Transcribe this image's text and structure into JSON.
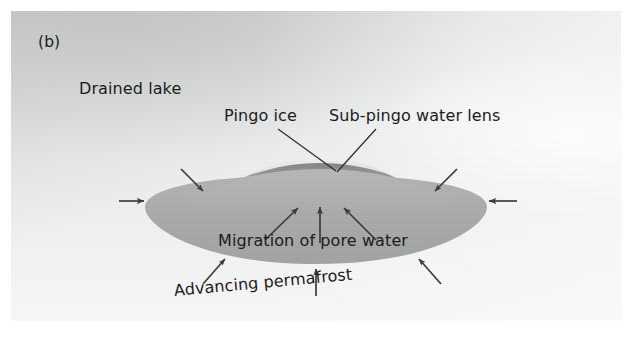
{
  "figure": {
    "panel_letter": "(b)",
    "caption_labels": {
      "drained_lake": "Drained lake",
      "pingo_ice": "Pingo ice",
      "sub_pingo_water_lens": "Sub-pingo water lens",
      "migration_of_pore_water": "Migration of pore water",
      "advancing_permafrost": "Advancing permafrost"
    },
    "colors": {
      "background_paper": "#ffffff",
      "plate_background": "#e9eaea",
      "plate_background_dark": "#c2c4c4",
      "talik_body": "#a8a9a9",
      "pingo_mound": "#b5b6b6",
      "water_lens_dark": "#8d8e8e",
      "pingo_ice_light": "#e3e4e4",
      "ink": "#1c1c1c",
      "arrow": "#3a3a3a"
    },
    "diagram": {
      "type": "cross-section schematic",
      "subject": "Pingo formation beneath a drained lake (closed-system / hydrostatic pingo)",
      "elements": [
        {
          "name": "drained-lake-surface",
          "description": "ground surface of a drained lake basin"
        },
        {
          "name": "unfrozen-talik",
          "description": "lens-shaped unfrozen saturated body below the lake basin"
        },
        {
          "name": "pingo-mound",
          "description": "domed uplift at the centre of the basin"
        },
        {
          "name": "pingo-ice-core",
          "description": "light ice core at the crest of the mound"
        },
        {
          "name": "sub-pingo-water-lens",
          "description": "dark water lens directly beneath the ice core"
        }
      ],
      "arrow_groups": [
        {
          "name": "pore-water-arrows",
          "count": 3,
          "direction": "upward/inward toward pingo core",
          "inside_talik": true
        },
        {
          "name": "permafrost-advance-arrows-top",
          "count": 2,
          "direction": "inward-downward from above the talik"
        },
        {
          "name": "permafrost-advance-arrows-sides",
          "count": 2,
          "direction": "horizontally inward at talik tips"
        },
        {
          "name": "permafrost-advance-arrows-bottom",
          "count": 3,
          "direction": "upward/inward from below the talik"
        }
      ]
    }
  }
}
